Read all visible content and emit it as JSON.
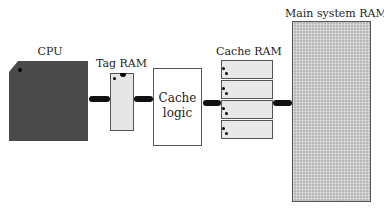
{
  "diagram": {
    "cpu": {
      "label": "CPU"
    },
    "tag_ram": {
      "label": "Tag RAM"
    },
    "cache_logic": {
      "line1": "Cache",
      "line2": "logic"
    },
    "cache_ram": {
      "label": "Cache RAM",
      "cells": 4
    },
    "main_ram": {
      "label": "Main system RAM"
    }
  },
  "colors": {
    "cpu_fill": "#4a4a4a",
    "tag_fill": "#e6e6e6",
    "main_fill": "#b8b8b8",
    "connector": "#111111"
  }
}
